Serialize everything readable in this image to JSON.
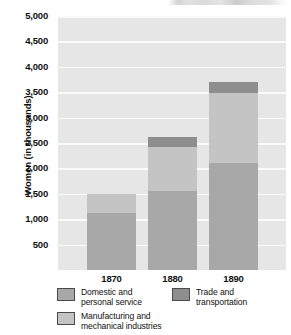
{
  "chart_data": {
    "type": "bar",
    "subtype": "stacked",
    "title": "",
    "xlabel": "",
    "ylabel": "Women (in thousands)",
    "categories": [
      "1870",
      "1880",
      "1890"
    ],
    "ylim": [
      0,
      5000
    ],
    "yticks": [
      "500",
      "1,000",
      "1,500",
      "2,000",
      "2,500",
      "3,000",
      "3,500",
      "4,000",
      "4,500",
      "5,000"
    ],
    "ytick_values": [
      500,
      1000,
      1500,
      2000,
      2500,
      3000,
      3500,
      4000,
      4500,
      5000
    ],
    "grid": true,
    "legend_position": "bottom",
    "series": [
      {
        "name": "Domestic and\npersonal service",
        "key": "domestic",
        "color": "#a8a8a8",
        "values": [
          1130,
          1560,
          2100
        ]
      },
      {
        "name": "Manufacturing and\nmechanical industries",
        "key": "manufacturing",
        "color": "#c4c4c4",
        "values": [
          370,
          860,
          1380
        ]
      },
      {
        "name": "Trade and\ntransportation",
        "key": "trade",
        "color": "#8e8e8e",
        "values": [
          0,
          200,
          220
        ]
      }
    ],
    "totals": [
      1500,
      2620,
      3700
    ]
  },
  "axes": {
    "y_title": "Women (in thousands)",
    "y_labels": [
      "5,000",
      "4,500",
      "4,000",
      "3,500",
      "3,000",
      "2,500",
      "2,000",
      "1,500",
      "1,000",
      "500"
    ],
    "x_labels": [
      "1870",
      "1880",
      "1890"
    ]
  },
  "legend": {
    "items": [
      {
        "label": "Domestic and\npersonal service",
        "color": "#a8a8a8"
      },
      {
        "label": "Trade and\ntransportation",
        "color": "#8e8e8e"
      },
      {
        "label": "Manufacturing and\nmechanical industries",
        "color": "#c4c4c4"
      }
    ]
  },
  "colors": {
    "plot_background": "#e6e6e6",
    "gridline": "#fbfbfb",
    "page_background": "#ffffff",
    "text": "#111111"
  }
}
